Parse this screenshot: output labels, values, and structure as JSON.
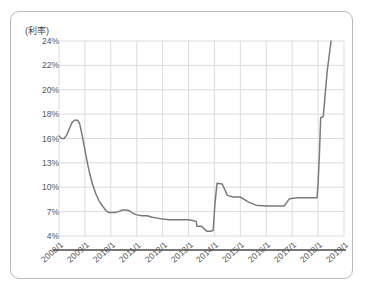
{
  "chart_data": {
    "type": "line",
    "title": "",
    "ylabel": "(利率)",
    "xlabel": "",
    "grid": true,
    "legend": "none",
    "line_color": "#7a7a7a",
    "grid_color": "#dcdcdc",
    "axis_color": "#555555",
    "y_tick_labels": [
      "24%",
      "22%",
      "20%",
      "18%",
      "16%",
      "13%",
      "10%",
      "7%",
      "4%"
    ],
    "y_tick_values": [
      24,
      22,
      20,
      18,
      16,
      13,
      10,
      7,
      4
    ],
    "x_tick_labels": [
      "2008/1",
      "2009/1",
      "2010/1",
      "2011/1",
      "2012/1",
      "2013/1",
      "2014/1",
      "2015/1",
      "2016/1",
      "2017/1",
      "2018/1",
      "2019/1"
    ],
    "x_tick_values": [
      2008.0,
      2009.0,
      2010.0,
      2011.0,
      2012.0,
      2013.0,
      2014.0,
      2015.0,
      2016.0,
      2017.0,
      2018.0,
      2019.0
    ],
    "xlim": [
      2008.0,
      2019.0
    ],
    "ylim": [
      4,
      24
    ],
    "series": [
      {
        "name": "利率",
        "x": [
          2008.0,
          2008.1,
          2008.2,
          2008.3,
          2008.42,
          2008.5,
          2008.6,
          2008.72,
          2008.8,
          2008.9,
          2009.0,
          2009.1,
          2009.2,
          2009.3,
          2009.42,
          2009.55,
          2009.7,
          2009.82,
          2009.92,
          2010.0,
          2010.15,
          2010.3,
          2010.45,
          2010.6,
          2010.72,
          2010.85,
          2011.0,
          2011.2,
          2011.4,
          2011.6,
          2011.8,
          2012.0,
          2012.25,
          2012.5,
          2012.75,
          2013.0,
          2013.15,
          2013.3,
          2013.32,
          2013.5,
          2013.7,
          2013.78,
          2013.8,
          2013.88,
          2013.95,
          2014.02,
          2014.1,
          2014.3,
          2014.5,
          2014.7,
          2014.85,
          2015.0,
          2015.3,
          2015.6,
          2016.0,
          2016.4,
          2016.7,
          2016.78,
          2016.9,
          2017.2,
          2017.6,
          2017.9,
          2017.96,
          2018.0,
          2018.05,
          2018.1,
          2018.2,
          2018.35,
          2018.5
        ],
        "y": [
          16.2,
          16.0,
          16.0,
          16.3,
          16.9,
          17.3,
          17.5,
          17.5,
          17.2,
          16.2,
          14.6,
          12.9,
          11.5,
          10.3,
          9.2,
          8.3,
          7.6,
          7.1,
          6.9,
          6.9,
          6.9,
          7.0,
          7.2,
          7.2,
          7.1,
          6.8,
          6.6,
          6.5,
          6.5,
          6.3,
          6.2,
          6.1,
          6.0,
          6.0,
          6.0,
          6.0,
          5.9,
          5.8,
          5.2,
          5.2,
          4.6,
          4.6,
          4.6,
          4.6,
          4.7,
          8.0,
          10.5,
          10.4,
          9.0,
          8.8,
          8.8,
          8.8,
          8.2,
          7.8,
          7.7,
          7.7,
          7.7,
          8.1,
          8.6,
          8.7,
          8.7,
          8.7,
          8.7,
          10.5,
          14.0,
          17.7,
          17.8,
          21.5,
          24.0
        ]
      }
    ]
  }
}
